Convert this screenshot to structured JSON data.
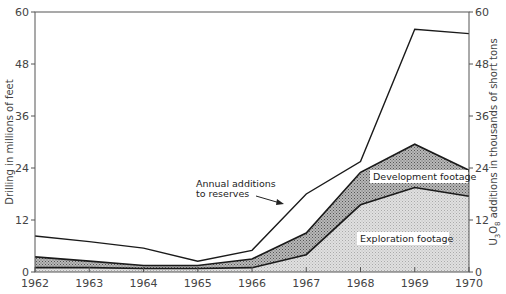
{
  "chart_data": {
    "type": "area",
    "title": "",
    "xlabel": "",
    "ylabel": "Drilling in millions of feet",
    "ylabel_right": "U3O8 additions in thousands of short tons",
    "ylim": [
      0,
      60
    ],
    "ylim_right": [
      0,
      60
    ],
    "yticks": [
      0,
      12,
      24,
      36,
      48,
      60
    ],
    "x": [
      1962,
      1963,
      1964,
      1965,
      1966,
      1967,
      1968,
      1969,
      1970
    ],
    "series": [
      {
        "name": "Exploration footage",
        "axis": "left",
        "kind": "area",
        "values": [
          1,
          1,
          0.8,
          0.8,
          1,
          4,
          15.5,
          19.5,
          17.5
        ]
      },
      {
        "name": "Development footage",
        "axis": "left",
        "kind": "area-stacked-total",
        "values": [
          3.5,
          2.5,
          1.5,
          1.5,
          3,
          9,
          23,
          29.5,
          23.5
        ]
      },
      {
        "name": "Annual additions to reserves",
        "axis": "right",
        "kind": "line",
        "values": [
          8.3,
          7,
          5.5,
          2.5,
          5,
          18,
          25.5,
          56,
          55
        ]
      }
    ],
    "annotations": [
      {
        "text": "Annual additions",
        "text2": "to reserves",
        "arrow_to": "Annual additions to reserves line near 1967"
      },
      {
        "text": "Development footage"
      },
      {
        "text": "Exploration footage"
      }
    ],
    "grid": false,
    "legend": "inline annotations"
  },
  "labels": {
    "ylabel_left": "Drilling in millions of feet",
    "ylabel_right_prefix": "U",
    "ylabel_right_sub1": "3",
    "ylabel_right_mid": "O",
    "ylabel_right_sub2": "8",
    "ylabel_right_suffix": " additions in thousands of short tons",
    "annot_additions_1": "Annual additions",
    "annot_additions_2": "to reserves",
    "annot_development": "Development footage",
    "annot_exploration": "Exploration footage"
  },
  "colors": {
    "exploration_fill": "#d8d8d8",
    "development_fill": "#a9a9a9",
    "line": "#1a1a1a",
    "axis": "#555555"
  }
}
